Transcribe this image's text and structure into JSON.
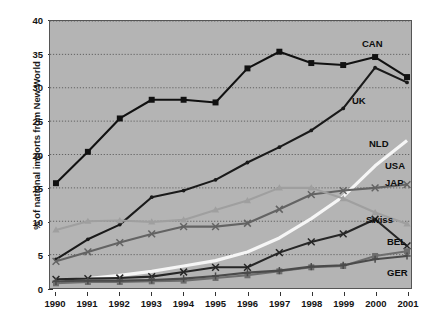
{
  "chart_data": {
    "type": "line",
    "title": "",
    "xlabel": "",
    "ylabel": "% of national imports from New World",
    "x": [
      1990,
      1991,
      1992,
      1993,
      1994,
      1995,
      1996,
      1997,
      1998,
      1999,
      2000,
      2001
    ],
    "xtick_labels": [
      "1990",
      "1991",
      "1992",
      "1993",
      "1994",
      "1995",
      "1996",
      "1997",
      "1998",
      "1999",
      "2000",
      "2001"
    ],
    "ytick_labels": [
      "0",
      "5",
      "10",
      "15",
      "20",
      "25",
      "30",
      "35",
      "40"
    ],
    "yticks": [
      0,
      5,
      10,
      15,
      20,
      25,
      30,
      35,
      40
    ],
    "ylim": [
      0,
      40
    ],
    "grid": true,
    "legend_position": "inline-right-of-series",
    "plot_background": "#b4b4b4",
    "series": [
      {
        "name": "CAN",
        "label": "CAN",
        "color": "#111111",
        "marker": "square",
        "values": [
          15.7,
          20.4,
          25.4,
          28.2,
          28.2,
          27.8,
          32.9,
          35.4,
          33.7,
          33.4,
          34.6,
          31.6
        ]
      },
      {
        "name": "UK",
        "label": "UK",
        "color": "#1a1a1a",
        "marker": "dot",
        "values": [
          4.3,
          7.3,
          9.5,
          13.6,
          14.6,
          16.2,
          18.8,
          21.1,
          23.6,
          26.9,
          33.0,
          30.8
        ]
      },
      {
        "name": "NLD",
        "label": "NLD",
        "color": "#f6f6f6",
        "marker": "none",
        "values": [
          1.0,
          1.4,
          1.9,
          2.5,
          3.3,
          4.1,
          5.4,
          7.5,
          10.4,
          13.7,
          18.3,
          22.1
        ]
      },
      {
        "name": "USA",
        "label": "USA",
        "color": "#636363",
        "marker": "x",
        "values": [
          4.0,
          5.4,
          6.8,
          8.1,
          9.2,
          9.2,
          9.7,
          11.8,
          14.0,
          14.6,
          15.0,
          15.5
        ]
      },
      {
        "name": "JAP",
        "label": "JAP",
        "color": "#9f9f9f",
        "marker": "triangle",
        "values": [
          8.7,
          10.0,
          10.1,
          9.9,
          10.2,
          11.7,
          13.1,
          15.0,
          15.0,
          13.4,
          11.3,
          9.6
        ]
      },
      {
        "name": "Swiss",
        "label": "Swiss",
        "color": "#262626",
        "marker": "x",
        "values": [
          1.3,
          1.4,
          1.5,
          1.7,
          2.4,
          3.1,
          3.1,
          5.3,
          6.9,
          8.1,
          10.3,
          6.3
        ]
      },
      {
        "name": "BEL",
        "label": "BEL",
        "color": "#6e6e6e",
        "marker": "square",
        "values": [
          0.7,
          0.9,
          0.9,
          1.0,
          1.1,
          1.5,
          1.9,
          2.5,
          3.1,
          3.3,
          4.8,
          5.5
        ]
      },
      {
        "name": "GER",
        "label": "GER",
        "color": "#4a4a4a",
        "marker": "plus",
        "values": [
          1.0,
          1.1,
          1.1,
          1.2,
          1.4,
          1.8,
          2.3,
          2.6,
          3.2,
          3.4,
          4.3,
          4.8
        ]
      }
    ],
    "series_label_positions": [
      {
        "name": "CAN",
        "x": 362,
        "y": 38
      },
      {
        "name": "UK",
        "x": 352,
        "y": 95
      },
      {
        "name": "NLD",
        "x": 369,
        "y": 138
      },
      {
        "name": "USA",
        "x": 385,
        "y": 160
      },
      {
        "name": "JAP",
        "x": 385,
        "y": 177
      },
      {
        "name": "Swiss",
        "x": 366,
        "y": 214
      },
      {
        "name": "BEL",
        "x": 387,
        "y": 236
      },
      {
        "name": "GER",
        "x": 387,
        "y": 267
      }
    ]
  }
}
